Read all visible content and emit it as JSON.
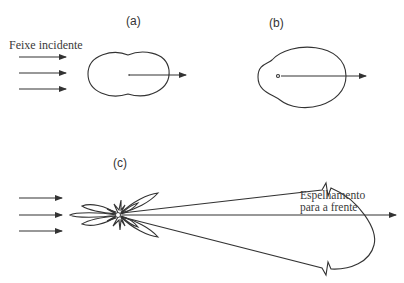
{
  "panels": {
    "a": {
      "label": "(a)"
    },
    "b": {
      "label": "(b)"
    },
    "c": {
      "label": "(c)"
    }
  },
  "annotations": {
    "incident_beam": "Feixe incidente",
    "forward_scatter_line1": "Espelhamento",
    "forward_scatter_line2": "para a frente"
  },
  "colors": {
    "line": "#333333",
    "background": "#ffffff"
  }
}
